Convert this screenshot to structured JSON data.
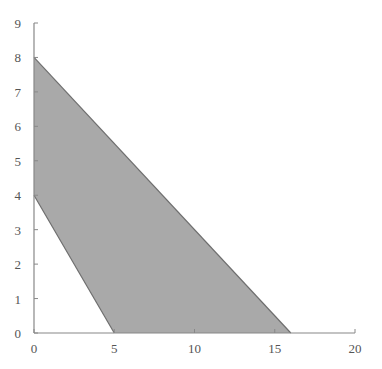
{
  "chart_data": {
    "type": "area",
    "title": "",
    "xlabel": "",
    "ylabel": "",
    "xlim": [
      0,
      20
    ],
    "ylim": [
      0,
      9
    ],
    "grid": false,
    "x_ticks": [
      0,
      5,
      10,
      15,
      20
    ],
    "y_ticks": [
      0,
      1,
      2,
      3,
      4,
      5,
      6,
      7,
      8,
      9
    ],
    "region": {
      "name": "feasible region",
      "vertices": [
        [
          0,
          8
        ],
        [
          16,
          0
        ],
        [
          5,
          0
        ],
        [
          0,
          4
        ]
      ],
      "fill": "#a9a9a9",
      "stroke": "#6e6e6e"
    },
    "lines": [
      {
        "name": "upper boundary",
        "points": [
          [
            0,
            8
          ],
          [
            16,
            0
          ]
        ]
      },
      {
        "name": "lower boundary",
        "points": [
          [
            0,
            4
          ],
          [
            5,
            0
          ]
        ]
      }
    ]
  },
  "axis_color": "#888888"
}
